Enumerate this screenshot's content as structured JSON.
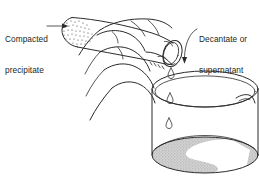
{
  "figure": {
    "kind": "line-drawing",
    "background_color": "#ffffff",
    "ink_color": "#2b2b2d",
    "liquid_fill_color": "#c9c9c9",
    "stipple_color": "#3a3a3a"
  },
  "labels": {
    "left": {
      "line1": "Compacted",
      "line2": "precipitate",
      "full_text": "Compacted precipitate",
      "pointer": "arrow-right",
      "points_at": "stippled-solid-in-test-tube-bottom"
    },
    "right": {
      "line1": "Decantate or",
      "line2": "supernatant",
      "full_text": "Decantate or supernatant",
      "pointer": "curved-leader-arrow-down-left",
      "points_at": "liquid-drop-at-tube-mouth"
    }
  },
  "objects": {
    "test_tube": {
      "name": "test-tube",
      "orientation": "tilted-mouth-down-right",
      "contents": "compacted-precipitate-stipple"
    },
    "hand": {
      "name": "hand",
      "pose": "gripping-tube-fingers-curled-down",
      "fingers_visible": 4
    },
    "beaker": {
      "name": "beaker",
      "features": [
        "elliptical-rim",
        "pouring-spout-right",
        "shaded-liquid-pool"
      ],
      "liquid": "swirled-supernatant"
    },
    "drops": {
      "name": "liquid-drops",
      "count": 3,
      "shape": "teardrop"
    }
  }
}
